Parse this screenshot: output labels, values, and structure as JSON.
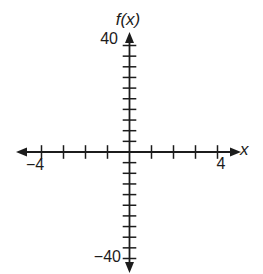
{
  "figure": {
    "background": "#ffffff",
    "ink_color": "#1c1c1c"
  },
  "labels": {
    "y_axis_title": "f(x)",
    "x_axis_title": "x",
    "y_max": "40",
    "y_min": "−40",
    "x_min": "−4",
    "x_max": "4"
  },
  "chart_data": {
    "type": "line",
    "title": "",
    "xlabel": "x",
    "ylabel": "f(x)",
    "series": [],
    "xlim": [
      -5,
      5
    ],
    "ylim": [
      -44,
      44
    ],
    "x_ticks": [
      -4,
      -3,
      -2,
      -1,
      1,
      2,
      3,
      4
    ],
    "x_tick_step": 1,
    "y_tick_step": 4,
    "y_ticks_count_each_side": 10,
    "x_labeled_ticks": [
      {
        "value": -4,
        "label": "−4"
      },
      {
        "value": 4,
        "label": "4"
      }
    ],
    "y_labeled_ticks": [
      {
        "value": 40,
        "label": "40"
      },
      {
        "value": -40,
        "label": "−40"
      }
    ],
    "grid": false,
    "legend": "none",
    "axes_style": "centered-cross-with-arrows"
  }
}
